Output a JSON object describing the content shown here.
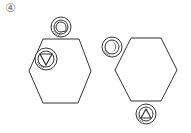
{
  "figure": {
    "label": "④",
    "colors": {
      "stroke": "#333333",
      "fill": "#ffffff",
      "hatch": "#888888",
      "ink": "#111111"
    },
    "panels": [
      {
        "name": "left-panel",
        "hexagon": {
          "points": "43,39 79,39 91,71 78,103 43,103 29,71"
        },
        "badges": [
          {
            "name": "top-badge",
            "cx": 61,
            "cy": 27,
            "r": 10,
            "symbol": "rounded-d"
          },
          {
            "name": "upper-left-badge",
            "cx": 46,
            "cy": 59,
            "r": 11,
            "symbol": "down-triangle"
          }
        ]
      },
      {
        "name": "right-panel",
        "hexagon": {
          "points": "131,38 161,38 177,70 161,101 131,101 115,70"
        },
        "badges": [
          {
            "name": "upper-left-badge",
            "cx": 112,
            "cy": 47,
            "r": 10,
            "symbol": "crescent"
          },
          {
            "name": "bottom-badge",
            "cx": 146,
            "cy": 114,
            "r": 10,
            "symbol": "up-triangle"
          }
        ]
      }
    ]
  }
}
